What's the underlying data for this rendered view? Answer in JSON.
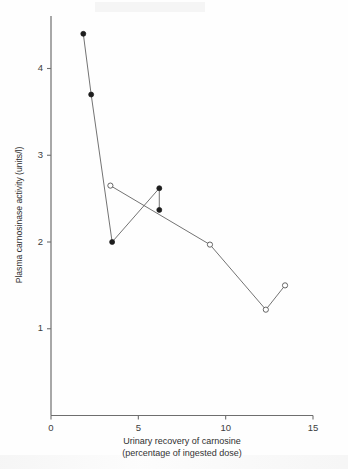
{
  "chart_data": {
    "type": "line",
    "title": "",
    "subtitle": "",
    "xlabel": "Urinary recovery of carnosine (percentage of ingested dose)",
    "xlabel_line1": "Urinary recovery of carnosine",
    "xlabel_line2": "(percentage of ingested dose)",
    "ylabel": "Plasma carnosinase activity (units/l)",
    "xlim": [
      0,
      15
    ],
    "ylim": [
      0,
      4.6
    ],
    "xticks": [
      0,
      5,
      10,
      15
    ],
    "xtick_labels": [
      "0",
      "5",
      "10",
      "15"
    ],
    "yticks": [
      1,
      2,
      3,
      4
    ],
    "ytick_labels": [
      "1",
      "2",
      "3",
      "4"
    ],
    "grid": false,
    "legend": "none",
    "marker_styles": {
      "filled": "filled-circle",
      "open": "open-circle"
    },
    "series": [
      {
        "name": "filled-circle-subject",
        "marker": "filled-circle",
        "points": [
          {
            "x": 1.85,
            "y": 4.4
          },
          {
            "x": 2.3,
            "y": 3.7
          },
          {
            "x": 3.5,
            "y": 2.0
          },
          {
            "x": 6.2,
            "y": 2.62
          },
          {
            "x": 6.2,
            "y": 2.37
          }
        ]
      },
      {
        "name": "open-circle-subject",
        "marker": "open-circle",
        "points": [
          {
            "x": 3.4,
            "y": 2.65
          },
          {
            "x": 9.1,
            "y": 1.97
          },
          {
            "x": 12.3,
            "y": 1.22
          },
          {
            "x": 13.4,
            "y": 1.5
          }
        ]
      }
    ]
  },
  "axes": {
    "x_axis_name": "x-axis",
    "y_axis_name": "y-axis"
  },
  "colors": {
    "axis": "#6e6e6e",
    "line": "#5a5a5a",
    "filled_marker": "#1d1d1d",
    "open_marker_stroke": "#555555",
    "open_marker_fill": "#ffffff",
    "text": "#3a3a3a",
    "background": "#fefefe"
  }
}
